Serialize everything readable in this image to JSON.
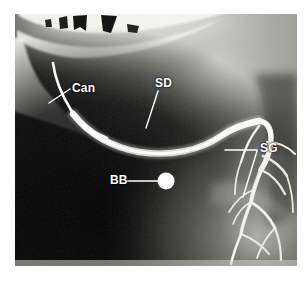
{
  "figure": {
    "kind": "radiograph",
    "modality": "sialogram",
    "background_color": "#ffffff",
    "film_background_color": "#0a0a0a",
    "contrast_color": "#f2f2f0",
    "annotation_color": "#ffffff",
    "frame": {
      "x": 15,
      "y": 14,
      "width": 282,
      "height": 252
    }
  },
  "annotations": [
    {
      "id": "can",
      "label": "Can",
      "meaning": "cannula",
      "label_x": 72,
      "label_y": 82,
      "leader": {
        "x1": 70,
        "y1": 89,
        "x2": 49,
        "y2": 103
      }
    },
    {
      "id": "sd",
      "label": "SD",
      "meaning": "submandibular duct",
      "label_x": 155,
      "label_y": 77,
      "leader": {
        "x1": 158,
        "y1": 91,
        "x2": 146,
        "y2": 128
      }
    },
    {
      "id": "sg",
      "label": "SG",
      "meaning": "submandibular gland",
      "label_x": 260,
      "label_y": 142,
      "leaders": [
        {
          "x1": 257,
          "y1": 150,
          "x2": 225,
          "y2": 150
        },
        {
          "x1": 257,
          "y1": 151,
          "x2": 243,
          "y2": 197
        }
      ]
    },
    {
      "id": "bb",
      "label": "BB",
      "meaning": "ball-bearing radiopaque marker",
      "label_x": 110,
      "label_y": 174,
      "leader": {
        "x1": 127,
        "y1": 181,
        "x2": 158,
        "y2": 181
      },
      "marker": {
        "cx": 166,
        "cy": 181,
        "r": 8.5,
        "color": "#ffffff"
      }
    }
  ],
  "anatomy": {
    "teeth": [
      {
        "x": 24,
        "y": 20,
        "w": 7,
        "h": 9
      },
      {
        "x": 38,
        "y": 18,
        "w": 12,
        "h": 13
      },
      {
        "x": 62,
        "y": 17,
        "w": 13,
        "h": 15
      },
      {
        "x": 88,
        "y": 25,
        "w": 9,
        "h": 8
      }
    ],
    "mandible_label": "mandible",
    "duct_label": "main submandibular duct",
    "gland_tree_label": "intraglandular ducts"
  }
}
